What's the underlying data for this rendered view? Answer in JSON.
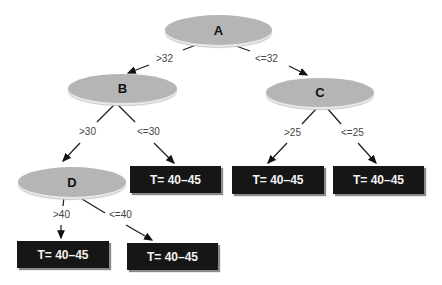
{
  "nodes": {
    "A": {
      "label": "A"
    },
    "B": {
      "label": "B"
    },
    "C": {
      "label": "C"
    },
    "D": {
      "label": "D"
    }
  },
  "leaves": [
    {
      "label": "T= 40–45"
    },
    {
      "label": "T= 40–45"
    },
    {
      "label": "T= 40–45"
    },
    {
      "label": "T= 40–45"
    },
    {
      "label": "T= 40–45"
    }
  ],
  "edges": {
    "a_gt": ">32",
    "a_le": "<=32",
    "b_gt": ">30",
    "b_le": "<=30",
    "c_gt": ">25",
    "c_le": "<=25",
    "d_gt": ">40",
    "d_le": "<=40"
  },
  "colors": {
    "node_fill": "#b5b5b5",
    "leaf_fill": "#161616",
    "leaf_text": "#f2f2f2"
  }
}
